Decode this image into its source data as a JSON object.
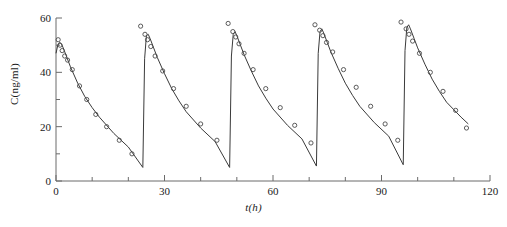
{
  "chart_data": {
    "type": "line",
    "title": "",
    "xlabel": "t(h)",
    "ylabel": "C(ng/ml)",
    "xlim": [
      0,
      120
    ],
    "ylim": [
      0,
      60
    ],
    "xticks": [
      0,
      30,
      60,
      90,
      120
    ],
    "xtick_labels": [
      "0",
      "30",
      "60",
      "90",
      "120"
    ],
    "xminor_step": 10,
    "yticks": [
      0,
      20,
      40,
      60
    ],
    "ytick_labels": [
      "0",
      "20",
      "40",
      "60"
    ],
    "yminor_step": 10,
    "grid": false,
    "legend": null,
    "dose_interval_h": 24,
    "n_doses": 5,
    "series": [
      {
        "name": "fitted model",
        "style": "solid-line",
        "color": "#3a3a3a",
        "x": [
          0,
          0.5,
          1,
          1.5,
          2,
          3,
          4,
          6,
          8,
          10,
          12,
          16,
          20,
          24,
          24.01,
          24.5,
          25,
          25.5,
          26,
          27,
          28,
          30,
          32,
          34,
          36,
          40,
          44,
          48,
          48.01,
          48.5,
          49,
          49.5,
          50,
          51,
          52,
          54,
          56,
          58,
          60,
          64,
          68,
          72,
          72.01,
          72.5,
          73,
          73.5,
          74,
          75,
          76,
          78,
          80,
          82,
          84,
          88,
          92,
          96,
          96.01,
          96.5,
          97,
          97.5,
          98,
          99,
          100,
          102,
          104,
          106,
          108,
          112,
          114
        ],
        "y": [
          47,
          50,
          51,
          50.5,
          49,
          45.5,
          42,
          36,
          31,
          27,
          23.5,
          17.5,
          12.5,
          5,
          5,
          45,
          53.5,
          54,
          52.5,
          49,
          45.5,
          39.5,
          34,
          29.5,
          25.5,
          19.5,
          14.5,
          5,
          5,
          46,
          54,
          55,
          53.5,
          50,
          46.5,
          40.5,
          35,
          30.5,
          26.5,
          20.5,
          15.5,
          5.5,
          5.5,
          47,
          55,
          56,
          54.5,
          51,
          47.5,
          41.5,
          36,
          31.5,
          27.5,
          21.5,
          16.5,
          6,
          6,
          48,
          56.5,
          57.5,
          56,
          52.5,
          49,
          43,
          37.5,
          33,
          29,
          23.5,
          21
        ]
      },
      {
        "name": "observed concentration",
        "style": "open-circle-markers",
        "color": "#4a4a4a",
        "points": [
          [
            0.6,
            52
          ],
          [
            1.1,
            50
          ],
          [
            1.7,
            48
          ],
          [
            2.4,
            46
          ],
          [
            3.2,
            44.5
          ],
          [
            4.5,
            41
          ],
          [
            6.5,
            35
          ],
          [
            8.5,
            30
          ],
          [
            11,
            24.5
          ],
          [
            14,
            20
          ],
          [
            17.5,
            15
          ],
          [
            21,
            10
          ],
          [
            23.4,
            57
          ],
          [
            24.6,
            54
          ],
          [
            25.3,
            52
          ],
          [
            26.2,
            49.5
          ],
          [
            27.4,
            46
          ],
          [
            29.5,
            40.5
          ],
          [
            32.5,
            34
          ],
          [
            36,
            27.5
          ],
          [
            40,
            21
          ],
          [
            44.5,
            15
          ],
          [
            47.6,
            58
          ],
          [
            48.9,
            55
          ],
          [
            49.7,
            53
          ],
          [
            50.6,
            50.5
          ],
          [
            52,
            47
          ],
          [
            54.5,
            41
          ],
          [
            58,
            34
          ],
          [
            62,
            27
          ],
          [
            66,
            20.5
          ],
          [
            70.5,
            14
          ],
          [
            71.6,
            57.5
          ],
          [
            72.9,
            55.5
          ],
          [
            73.8,
            53.5
          ],
          [
            74.8,
            51
          ],
          [
            76.5,
            47.5
          ],
          [
            79.5,
            41
          ],
          [
            83,
            34.5
          ],
          [
            87,
            27.5
          ],
          [
            91,
            21
          ],
          [
            94.5,
            15
          ],
          [
            95.4,
            58.5
          ],
          [
            96.8,
            56
          ],
          [
            97.6,
            54
          ],
          [
            98.6,
            51.5
          ],
          [
            100.5,
            47
          ],
          [
            103.5,
            40
          ],
          [
            107,
            33
          ],
          [
            110.5,
            26
          ],
          [
            113.5,
            19.5
          ]
        ]
      }
    ]
  },
  "axes": {
    "x_axis_label": "t(h)",
    "y_axis_label": "C(ng/ml)"
  },
  "caption": ""
}
